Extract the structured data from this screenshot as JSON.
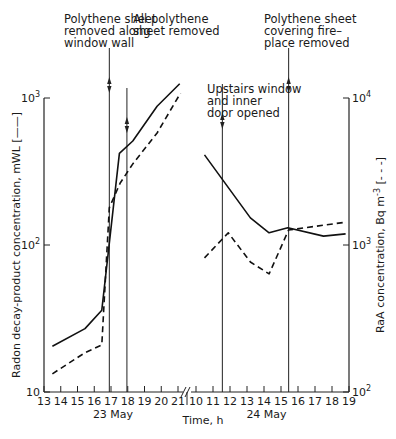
{
  "chart_data": {
    "type": "line",
    "title": "",
    "xlabel": "Time, h",
    "ylabel_left": "Radon decay-product concentration, mWL (—)",
    "ylabel_right": "RaA concentration, Bq m⁻³ (- - -)",
    "ylabel_left_text": "Radon decay-product concentration, mWL",
    "ylabel_left_legend": "[——]",
    "ylabel_right_text": "RaA concentration, Bq m",
    "ylabel_right_sup": "-3",
    "ylabel_right_legend": "[- - -]",
    "yscale": "log",
    "ylim_left": [
      10,
      1000
    ],
    "ylim_right": [
      100,
      10000
    ],
    "left_tick_labels": [
      {
        "base": "10",
        "exp": ""
      },
      {
        "base": "10",
        "exp": "2"
      },
      {
        "base": "10",
        "exp": "3"
      }
    ],
    "right_tick_labels": [
      {
        "base": "10",
        "exp": "2"
      },
      {
        "base": "10",
        "exp": "3"
      },
      {
        "base": "10",
        "exp": "4"
      }
    ],
    "left_tick_values": [
      10,
      100,
      1000
    ],
    "right_tick_values": [
      100,
      1000,
      10000
    ],
    "panels": [
      {
        "day_label": "23 May",
        "xlim": [
          13,
          21
        ],
        "x_ticks": [
          13,
          14,
          15,
          16,
          17,
          18,
          19,
          20,
          21
        ],
        "x_tick_labels": [
          "13",
          "14",
          "15",
          "16",
          "17",
          "18",
          "19",
          "20",
          "21"
        ]
      },
      {
        "day_label": "24 May",
        "xlim": [
          10,
          19
        ],
        "x_ticks": [
          10,
          11,
          12,
          13,
          14,
          15,
          16,
          17,
          18,
          19
        ],
        "x_tick_labels": [
          "10",
          "11",
          "12",
          "13",
          "14",
          "15",
          "16",
          "17",
          "18",
          "19"
        ]
      }
    ],
    "series": [
      {
        "name": "Radon decay-product concentration (mWL)",
        "style": "solid",
        "axis": "left",
        "segments": [
          {
            "panel": 0,
            "x": [
              13.5,
              15.45,
              16.45,
              17.5,
              18.3,
              19.75,
              21.1
            ],
            "y": [
              20.5,
              27,
              36,
              420,
              510,
              880,
              1250
            ]
          },
          {
            "panel": 1,
            "x": [
              10.5,
              13.2,
              14.3,
              15.4,
              17.5,
              18.8
            ],
            "y": [
              410,
              153,
              121,
              131,
              115,
              119
            ]
          }
        ]
      },
      {
        "name": "RaA concentration (Bq m-3)",
        "style": "dashed",
        "axis": "right",
        "segments": [
          {
            "panel": 0,
            "x": [
              13.5,
              15.45,
              16.45,
              16.9,
              17.55,
              18.3,
              19.75,
              21.15
            ],
            "y": [
              133,
              185,
              209,
              1790,
              2640,
              3560,
              5780,
              10800
            ]
          },
          {
            "panel": 1,
            "x": [
              10.5,
              11.9,
              13.2,
              14.3,
              15.45,
              18.8
            ],
            "y": [
              817,
              1210,
              766,
              636,
              1265,
              1430
            ]
          }
        ]
      }
    ],
    "annotations": [
      {
        "panel": 0,
        "x": 16.9,
        "lines": [
          "Polythene sheet",
          "removed along",
          "window wall"
        ]
      },
      {
        "panel": 0,
        "x": 17.95,
        "lines": [
          "All polythene",
          "sheet removed"
        ]
      },
      {
        "panel": 1,
        "x": 11.55,
        "lines": [
          "Upstairs window",
          "and inner",
          "door opened"
        ]
      },
      {
        "panel": 1,
        "x": 15.45,
        "lines": [
          "Polythene sheet",
          "covering fire–",
          "place removed"
        ]
      }
    ],
    "grid": false,
    "legend": "axis-labels"
  }
}
